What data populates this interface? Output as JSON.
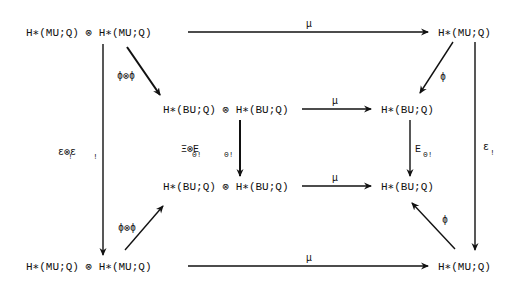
{
  "nodes": {
    "top_left": "H∗(MU;Q) ⊗ H∗(MU;Q)",
    "top_right": "H∗(MU;Q)",
    "mid_upper_left": "H∗(BU;Q) ⊗ H∗(BU;Q)",
    "mid_upper_right": "H∗(BU;Q)",
    "mid_lower_left": "H∗(BU;Q) ⊗ H∗(BU;Q)",
    "mid_lower_right": "H∗(BU;Q)",
    "bottom_left": "H∗(MU;Q) ⊗ H∗(MU;Q)",
    "bottom_right": "H∗(MU;Q)"
  },
  "labels": {
    "top_mu": "μ",
    "upper_mu": "μ",
    "lower_mu": "μ",
    "bottom_mu": "μ",
    "phi_tensor_phi_upper": "ϕ⊗ϕ",
    "phi_tensor_phi_lower": "ϕ⊗ϕ",
    "phi_upper": "ϕ",
    "phi_lower": "ϕ",
    "eps_tensor_eps": "ε⊗ε",
    "eps_sub": "!",
    "eps_right": "ε",
    "Xi_tensor_E": "Ξ⊗E",
    "Xi_E_sub": "0!",
    "E_right": "E",
    "E_right_sub": "0!"
  }
}
